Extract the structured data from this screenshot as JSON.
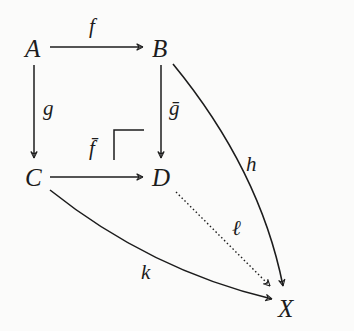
{
  "diagram": {
    "type": "commutative-diagram-pushout",
    "nodes": {
      "A": "A",
      "B": "B",
      "C": "C",
      "D": "D",
      "X": "X"
    },
    "arrows": [
      {
        "from": "A",
        "to": "B",
        "label": "f",
        "style": "solid"
      },
      {
        "from": "A",
        "to": "C",
        "label": "g",
        "style": "solid"
      },
      {
        "from": "B",
        "to": "D",
        "label": "ḡ",
        "style": "solid"
      },
      {
        "from": "C",
        "to": "D",
        "label": "f̄",
        "style": "solid"
      },
      {
        "from": "B",
        "to": "X",
        "label": "h",
        "style": "solid-curved"
      },
      {
        "from": "C",
        "to": "X",
        "label": "k",
        "style": "solid-curved"
      },
      {
        "from": "D",
        "to": "X",
        "label": "ℓ",
        "style": "dotted"
      }
    ],
    "labels": {
      "f": "f",
      "g": "g",
      "g_bar": "ḡ",
      "f_bar": "f̄",
      "h": "h",
      "k": "k",
      "l": "ℓ"
    },
    "pushout_corner_marker": true,
    "colors": {
      "ink": "#1c1c1c",
      "background": "#fbfbfa"
    }
  }
}
